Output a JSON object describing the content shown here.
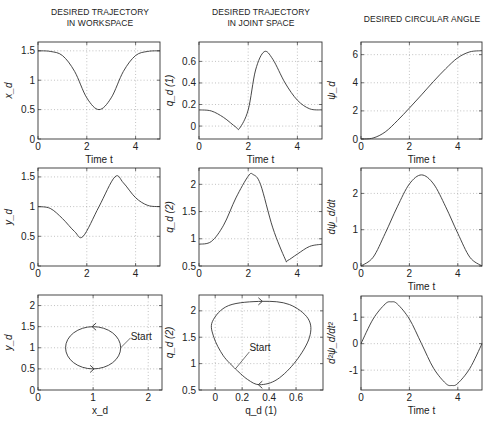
{
  "column_titles": [
    "DESIRED TRAJECTORY\nIN WORKSPACE",
    "DESIRED TRAJECTORY\nIN JOINT SPACE",
    "DESIRED CIRCULAR ANGLE"
  ],
  "chart_data": [
    {
      "id": "xd",
      "type": "line",
      "title": "",
      "xlabel": "Time t",
      "ylabel": "x_d",
      "xlim": [
        0,
        5
      ],
      "ylim": [
        0,
        1.65
      ],
      "xticks": [
        0,
        2,
        4
      ],
      "yticks": [
        0,
        0.5,
        1,
        1.5
      ],
      "ytick_labels": [
        "0",
        "0.5",
        "1",
        "1.5"
      ],
      "grid": true,
      "x": [
        0,
        0.5,
        1,
        1.5,
        2,
        2.5,
        3,
        3.5,
        4,
        4.5,
        5
      ],
      "y": [
        1.5,
        1.49,
        1.42,
        1.15,
        0.7,
        0.5,
        0.7,
        1.15,
        1.42,
        1.49,
        1.5
      ]
    },
    {
      "id": "yd",
      "type": "line",
      "title": "",
      "xlabel": "Time t",
      "ylabel": "y_d",
      "xlim": [
        0,
        5
      ],
      "ylim": [
        0,
        1.65
      ],
      "xticks": [
        0,
        2,
        4
      ],
      "yticks": [
        0,
        0.5,
        1,
        1.5
      ],
      "ytick_labels": [
        "0",
        "0.5",
        "1",
        "1.5"
      ],
      "grid": true,
      "x": [
        0,
        0.5,
        1,
        1.5,
        1.85,
        2.5,
        3.15,
        3.5,
        4,
        4.5,
        5
      ],
      "y": [
        1.0,
        0.97,
        0.8,
        0.58,
        0.5,
        1.0,
        1.5,
        1.4,
        1.15,
        1.02,
        1.0
      ]
    },
    {
      "id": "xy-path",
      "type": "line",
      "title": "",
      "xlabel": "x_d",
      "ylabel": "y_d",
      "xlim": [
        0,
        2.25
      ],
      "ylim": [
        0,
        2.25
      ],
      "xticks": [
        0,
        1,
        2
      ],
      "yticks": [
        0,
        0.5,
        1,
        1.5,
        2
      ],
      "ytick_labels": [
        "0",
        "0.5",
        "1",
        "1.5",
        "2"
      ],
      "grid": true,
      "shape": "circle",
      "center": [
        1.0,
        1.0
      ],
      "radius": 0.5,
      "annotations": [
        {
          "text": "Start",
          "x": 1.5,
          "y": 1.0
        }
      ]
    },
    {
      "id": "qd1",
      "type": "line",
      "title": "",
      "xlabel": "Time t",
      "ylabel": "q_d (1)",
      "xlim": [
        0,
        5
      ],
      "ylim": [
        -0.12,
        0.78
      ],
      "xticks": [
        0,
        2,
        4
      ],
      "yticks": [
        0,
        0.2,
        0.4,
        0.6
      ],
      "ytick_labels": [
        "0",
        "0.2",
        "0.4",
        "0.6"
      ],
      "grid": true,
      "x": [
        0,
        0.5,
        1,
        1.5,
        1.65,
        2,
        2.3,
        2.65,
        3,
        3.5,
        4,
        4.5,
        5
      ],
      "y": [
        0.15,
        0.14,
        0.08,
        -0.01,
        -0.02,
        0.15,
        0.52,
        0.69,
        0.62,
        0.4,
        0.24,
        0.16,
        0.15
      ]
    },
    {
      "id": "qd2",
      "type": "line",
      "title": "",
      "xlabel": "Time t",
      "ylabel": "q_d (2)",
      "xlim": [
        0,
        5
      ],
      "ylim": [
        0.5,
        2.3
      ],
      "xticks": [
        0,
        2,
        4
      ],
      "yticks": [
        0.5,
        1,
        1.5,
        2
      ],
      "ytick_labels": [
        "0.5",
        "1",
        "1.5",
        "2"
      ],
      "grid": true,
      "x": [
        0,
        0.5,
        1,
        1.5,
        2,
        2.2,
        2.5,
        3,
        3.5,
        3.6,
        4,
        4.5,
        5
      ],
      "y": [
        0.9,
        0.95,
        1.25,
        1.75,
        2.15,
        2.18,
        2.0,
        1.2,
        0.63,
        0.6,
        0.72,
        0.86,
        0.9
      ]
    },
    {
      "id": "joint-path",
      "type": "line",
      "title": "",
      "xlabel": "q_d (1)",
      "ylabel": "q_d (2)",
      "xlim": [
        -0.12,
        0.8
      ],
      "ylim": [
        0.5,
        2.3
      ],
      "xticks": [
        0,
        0.2,
        0.4,
        0.6
      ],
      "yticks": [
        0.5,
        1,
        1.5,
        2
      ],
      "xtick_labels": [
        "0",
        "0.2",
        "0.4",
        "0.6"
      ],
      "ytick_labels": [
        "0.5",
        "1",
        "1.5",
        "2"
      ],
      "grid": true,
      "annotations": [
        {
          "text": "Start",
          "x": 0.15,
          "y": 0.9
        }
      ]
    },
    {
      "id": "psi",
      "type": "line",
      "title": "",
      "xlabel": "Time t",
      "ylabel": "ψ_d",
      "xlim": [
        0,
        5
      ],
      "ylim": [
        0,
        6.9
      ],
      "xticks": [
        0,
        2,
        4
      ],
      "yticks": [
        0,
        2,
        4,
        6
      ],
      "ytick_labels": [
        "0",
        "2",
        "4",
        "6"
      ],
      "grid": true,
      "x": [
        0,
        0.5,
        1,
        1.5,
        2,
        2.5,
        3,
        3.5,
        4,
        4.5,
        5
      ],
      "y": [
        0,
        0.07,
        0.5,
        1.3,
        2.2,
        3.14,
        4.1,
        5.0,
        5.78,
        6.2,
        6.28
      ]
    },
    {
      "id": "dpsi",
      "type": "line",
      "title": "",
      "xlabel": "Time t",
      "ylabel": "dψ_d/dt",
      "xlim": [
        0,
        5
      ],
      "ylim": [
        0,
        2.7
      ],
      "xticks": [
        0,
        2,
        4
      ],
      "yticks": [
        0,
        1,
        2
      ],
      "ytick_labels": [
        "0",
        "1",
        "2"
      ],
      "grid": true,
      "x": [
        0,
        0.5,
        1,
        1.5,
        2,
        2.5,
        3,
        3.5,
        4,
        4.5,
        5
      ],
      "y": [
        0,
        0.24,
        0.9,
        1.63,
        2.26,
        2.51,
        2.26,
        1.63,
        0.9,
        0.24,
        0
      ]
    },
    {
      "id": "ddpsi",
      "type": "line",
      "title": "",
      "xlabel": "Time t",
      "ylabel": "d²ψ_d/dt²",
      "xlim": [
        0,
        5
      ],
      "ylim": [
        -1.75,
        1.8
      ],
      "xticks": [
        0,
        2,
        4
      ],
      "yticks": [
        -1,
        0,
        1
      ],
      "ytick_labels": [
        "-1",
        "0",
        "1"
      ],
      "grid": true,
      "x": [
        0,
        0.5,
        1,
        1.25,
        1.5,
        2,
        2.5,
        3,
        3.5,
        3.75,
        4,
        4.5,
        5
      ],
      "y": [
        0,
        0.93,
        1.5,
        1.58,
        1.5,
        0.93,
        0,
        -0.93,
        -1.5,
        -1.58,
        -1.5,
        -0.93,
        0
      ]
    }
  ],
  "labels": {
    "time": "Time t",
    "start": "Start"
  }
}
